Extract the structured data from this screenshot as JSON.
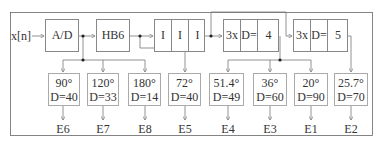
{
  "diagram": {
    "input_label": "x[n]",
    "blocks": {
      "ad": {
        "label": "A/D"
      },
      "hb6": {
        "label": "HB6"
      },
      "interp": {
        "cells": [
          "I",
          "I",
          "I"
        ]
      },
      "delay4": {
        "cells": [
          "3x",
          "D=",
          "4"
        ]
      },
      "delay5": {
        "cells": [
          "3x",
          "D=",
          "5"
        ]
      }
    },
    "outputs": [
      {
        "angle": "90°",
        "d": "D=40",
        "label": "E6"
      },
      {
        "angle": "120°",
        "d": "D=33",
        "label": "E7"
      },
      {
        "angle": "180°",
        "d": "D=14",
        "label": "E8"
      },
      {
        "angle": "72°",
        "d": "D=40",
        "label": "E5"
      },
      {
        "angle": "51.4°",
        "d": "D=49",
        "label": "E4"
      },
      {
        "angle": "36°",
        "d": "D=60",
        "label": "E3"
      },
      {
        "angle": "20°",
        "d": "D=90",
        "label": "E1"
      },
      {
        "angle": "25.7°",
        "d": "D=70",
        "label": "E2"
      }
    ]
  }
}
